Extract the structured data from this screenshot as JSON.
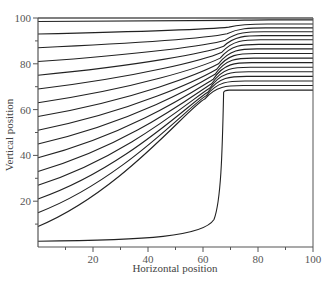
{
  "chart_data": {
    "type": "line",
    "title": "",
    "xlabel": "Horizontal position",
    "ylabel": "Vertical position",
    "xlim": [
      0,
      100
    ],
    "ylim": [
      0,
      100
    ],
    "x_ticks": [
      20,
      40,
      60,
      80,
      100
    ],
    "y_ticks": [
      20,
      40,
      60,
      80,
      100
    ],
    "grid": false,
    "legend": null,
    "obstacle": {
      "x_start": 67,
      "x_end": 100,
      "y_top": 68
    },
    "series": [
      {
        "name": "streamline-1",
        "start_y": 2.5,
        "end_y": 68.5,
        "wall_x": 67.5
      },
      {
        "name": "streamline-2",
        "start_y": 9,
        "end_y": 70.5
      },
      {
        "name": "streamline-3",
        "start_y": 15,
        "end_y": 72.5
      },
      {
        "name": "streamline-4",
        "start_y": 21,
        "end_y": 74.5
      },
      {
        "name": "streamline-5",
        "start_y": 27,
        "end_y": 76.5
      },
      {
        "name": "streamline-6",
        "start_y": 33,
        "end_y": 78.5
      },
      {
        "name": "streamline-7",
        "start_y": 39,
        "end_y": 80.5
      },
      {
        "name": "streamline-8",
        "start_y": 45,
        "end_y": 82.5
      },
      {
        "name": "streamline-9",
        "start_y": 51,
        "end_y": 84.5
      },
      {
        "name": "streamline-10",
        "start_y": 57,
        "end_y": 86.5
      },
      {
        "name": "streamline-11",
        "start_y": 63,
        "end_y": 88.5
      },
      {
        "name": "streamline-12",
        "start_y": 69,
        "end_y": 90.5
      },
      {
        "name": "streamline-13",
        "start_y": 75,
        "end_y": 92.3
      },
      {
        "name": "streamline-14",
        "start_y": 81,
        "end_y": 94
      },
      {
        "name": "streamline-15",
        "start_y": 87,
        "end_y": 95.7
      },
      {
        "name": "streamline-16",
        "start_y": 93,
        "end_y": 97.4
      },
      {
        "name": "streamline-17",
        "start_y": 98.5,
        "end_y": 99.2
      }
    ]
  }
}
